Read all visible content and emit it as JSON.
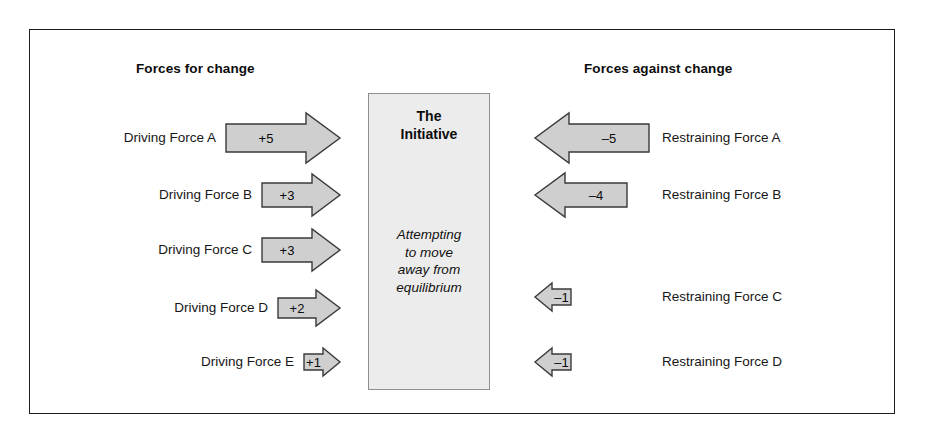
{
  "diagram": {
    "headings": {
      "left": "Forces for change",
      "right": "Forces against change"
    },
    "center": {
      "title_line1": "The",
      "title_line2": "Initiative",
      "sub_line1": "Attempting",
      "sub_line2": "to move",
      "sub_line3": "away from",
      "sub_line4": "equilibrium"
    },
    "colors": {
      "arrow_fill": "#cfcfcf",
      "arrow_stroke": "#3a3a3a",
      "box_fill": "#ececec",
      "box_stroke": "#8f8f8f",
      "frame_stroke": "#1d1d1d",
      "text": "#0c0c0c"
    },
    "driving_forces": [
      {
        "label": "Driving Force A",
        "value": "+5",
        "magnitude": 5
      },
      {
        "label": "Driving Force B",
        "value": "+3",
        "magnitude": 3
      },
      {
        "label": "Driving Force C",
        "value": "+3",
        "magnitude": 3
      },
      {
        "label": "Driving Force D",
        "value": "+2",
        "magnitude": 2
      },
      {
        "label": "Driving Force E",
        "value": "+1",
        "magnitude": 1
      }
    ],
    "restraining_forces": [
      {
        "label": "Restraining Force A",
        "value": "–5",
        "magnitude": 5
      },
      {
        "label": "Restraining Force B",
        "value": "–4",
        "magnitude": 4
      },
      {
        "label": "Restraining Force C",
        "value": "–1",
        "magnitude": 1
      },
      {
        "label": "Restraining Force D",
        "value": "–1",
        "magnitude": 1
      }
    ]
  },
  "chart_data": {
    "type": "bar",
    "xlabel": "",
    "ylabel": "",
    "series": [
      {
        "name": "Forces for change",
        "categories": [
          "Driving Force A",
          "Driving Force B",
          "Driving Force C",
          "Driving Force D",
          "Driving Force E"
        ],
        "values": [
          5,
          3,
          3,
          2,
          1
        ]
      },
      {
        "name": "Forces against change",
        "categories": [
          "Restraining Force A",
          "Restraining Force B",
          "Restraining Force C",
          "Restraining Force D"
        ],
        "values": [
          -5,
          -4,
          -1,
          -1
        ]
      }
    ]
  }
}
